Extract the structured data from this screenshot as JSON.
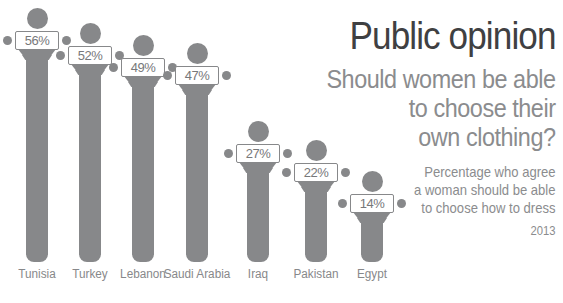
{
  "header": {
    "title": "Public opinion",
    "subtitle_lines": [
      "Should women be able",
      "to choose their",
      "own clothing?"
    ],
    "note_lines": [
      "Percentage who agree",
      "a woman should be able",
      "to choose how to dress"
    ],
    "year": "2013"
  },
  "colors": {
    "figure": "#87888a",
    "title_text": "#3f4042",
    "subtitle_text": "#8b8c8e",
    "sign_bg": "#ffffff",
    "sign_text": "#77787a",
    "label_text": "#87888a"
  },
  "chart_data": {
    "type": "bar",
    "categories": [
      "Tunisia",
      "Turkey",
      "Lebanon",
      "Saudi Arabia",
      "Iraq",
      "Pakistan",
      "Egypt"
    ],
    "values": [
      56,
      52,
      49,
      47,
      27,
      22,
      14
    ],
    "value_labels": [
      "56%",
      "52%",
      "49%",
      "47%",
      "22%",
      "14%"
    ],
    "title": "Public opinion",
    "subtitle": "Should women be able to choose their own clothing?",
    "note": "Percentage who agree a woman should be able to choose how to dress",
    "year": "2013",
    "unit": "percent",
    "ylim": [
      0,
      60
    ],
    "legend": false,
    "grid": false,
    "orientation": "vertical",
    "bar_style": "person-holding-sign"
  }
}
